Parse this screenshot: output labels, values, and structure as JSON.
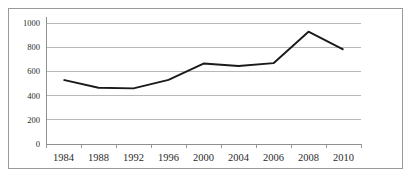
{
  "chart_data": {
    "type": "line",
    "title": "",
    "xlabel": "",
    "ylabel": "",
    "categories": [
      "1984",
      "1988",
      "1992",
      "1996",
      "2000",
      "2004",
      "2006",
      "2008",
      "2010"
    ],
    "values": [
      530,
      465,
      460,
      530,
      665,
      645,
      668,
      928,
      780
    ],
    "series": [
      {
        "name": "",
        "values": [
          530,
          465,
          460,
          530,
          665,
          645,
          668,
          928,
          780
        ],
        "color": "#1a1a1a"
      }
    ],
    "ylim": [
      0,
      1000
    ],
    "ytick_labels": [
      "1000",
      "800",
      "600",
      "400",
      "200",
      "0"
    ],
    "ytick_values": [
      1000,
      800,
      600,
      400,
      200,
      0
    ],
    "xtick_labels": [
      "1984",
      "1988",
      "1992",
      "1996",
      "2000",
      "2004",
      "2006",
      "2008",
      "2010"
    ],
    "grid": "horizontal",
    "legend": "none",
    "colors": {
      "line": "#1a1a1a",
      "gridline": "#b0b0b0",
      "axis": "#8f8f8f",
      "frame": "#9a9a9a",
      "background": "#ffffff",
      "text": "#2b2b2b"
    }
  }
}
